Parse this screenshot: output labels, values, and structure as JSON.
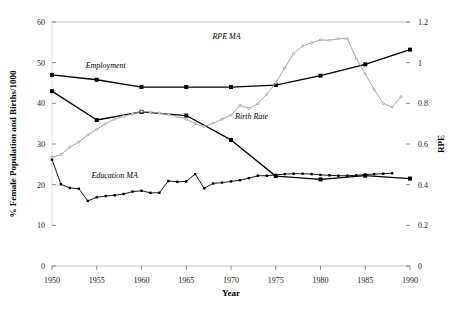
{
  "chart_data": {
    "type": "line",
    "title": "",
    "xlabel": "Year",
    "ylabel": "% Female Population and Births/1000",
    "y2label": "RPE",
    "xlim": [
      1950,
      1990
    ],
    "ylim": [
      0,
      60
    ],
    "y2lim": [
      0,
      1.2
    ],
    "grid": false,
    "legend_position": "inline-annotations",
    "xticks": [
      "1950",
      "1955",
      "1960",
      "1965",
      "1970",
      "1975",
      "1980",
      "1985",
      "1990"
    ],
    "xtick_values": [
      1950,
      1955,
      1960,
      1965,
      1970,
      1975,
      1980,
      1985,
      1990
    ],
    "yticks": [
      "0",
      "10",
      "20",
      "30",
      "40",
      "50",
      "60"
    ],
    "ytick_values": [
      0,
      10,
      20,
      30,
      40,
      50,
      60
    ],
    "y2ticks": [
      "0",
      "0.2",
      "0.4",
      "0.6",
      "0.8",
      "1",
      "1.2"
    ],
    "y2tick_values": [
      0,
      0.2,
      0.4,
      0.6,
      0.8,
      1,
      1.2
    ],
    "series": [
      {
        "name": "Employment",
        "axis": "left",
        "color": "#000000",
        "marker": "square",
        "label_x": 1956.0,
        "label_y": 48.6,
        "x": [
          1950,
          1955,
          1960,
          1965,
          1970,
          1975,
          1980,
          1985,
          1990
        ],
        "values": [
          47.0,
          45.8,
          44.0,
          44.0,
          44.0,
          44.5,
          46.8,
          49.6,
          53.2
        ]
      },
      {
        "name": "Birth Rate",
        "axis": "left",
        "color": "#000000",
        "marker": "square",
        "label_x": 1972.3,
        "label_y": 36.2,
        "x": [
          1950,
          1955,
          1960,
          1965,
          1970,
          1975,
          1980,
          1985,
          1990
        ],
        "values": [
          43.0,
          35.9,
          37.9,
          37.0,
          31.0,
          22.1,
          21.3,
          22.2,
          21.5
        ]
      },
      {
        "name": "Education MA",
        "axis": "left",
        "color": "#000000",
        "marker": "square-small",
        "label_x": 1957.0,
        "label_y": 21.6,
        "x": [
          1950,
          1951,
          1952,
          1953,
          1954,
          1955,
          1956,
          1957,
          1958,
          1959,
          1960,
          1961,
          1962,
          1963,
          1964,
          1965,
          1966,
          1967,
          1968,
          1969,
          1970,
          1971,
          1972,
          1973,
          1974,
          1975,
          1976,
          1977,
          1978,
          1979,
          1980,
          1981,
          1982,
          1983,
          1984,
          1985,
          1986,
          1987,
          1988
        ],
        "values": [
          26.2,
          20.1,
          19.2,
          19.0,
          16.0,
          16.9,
          17.2,
          17.4,
          17.7,
          18.3,
          18.5,
          18.0,
          18.0,
          20.9,
          20.7,
          20.8,
          22.6,
          19.1,
          20.3,
          20.5,
          20.8,
          21.1,
          21.6,
          22.2,
          22.2,
          22.4,
          22.6,
          22.7,
          22.7,
          22.6,
          22.4,
          22.3,
          22.2,
          22.2,
          22.3,
          22.5,
          22.6,
          22.7,
          22.8
        ]
      },
      {
        "name": "RPE MA",
        "axis": "right",
        "color": "#9a9a9a",
        "marker": "dot",
        "label_x": 1969.5,
        "label_y": 1.115,
        "x": [
          1950,
          1951,
          1952,
          1953,
          1954,
          1955,
          1956,
          1957,
          1958,
          1959,
          1960,
          1961,
          1962,
          1963,
          1964,
          1965,
          1966,
          1967,
          1968,
          1969,
          1970,
          1971,
          1972,
          1973,
          1974,
          1975,
          1976,
          1977,
          1978,
          1979,
          1980,
          1981,
          1982,
          1983,
          1984,
          1985,
          1986,
          1987,
          1988,
          1989
        ],
        "values": [
          0.535,
          0.548,
          0.585,
          0.61,
          0.645,
          0.672,
          0.7,
          0.722,
          0.737,
          0.748,
          0.76,
          0.757,
          0.752,
          0.745,
          0.735,
          0.722,
          0.7,
          0.685,
          0.702,
          0.722,
          0.742,
          0.79,
          0.775,
          0.798,
          0.845,
          0.9,
          0.975,
          1.045,
          1.082,
          1.098,
          1.112,
          1.11,
          1.118,
          1.118,
          1.02,
          0.945,
          0.868,
          0.8,
          0.782,
          0.832
        ]
      }
    ]
  }
}
